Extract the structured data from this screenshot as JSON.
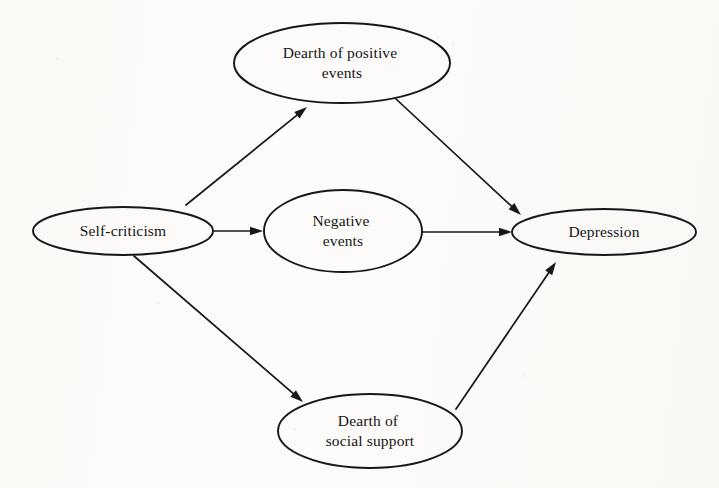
{
  "figure": {
    "background_color": "#fbfaf8",
    "stroke_color": "#17171a",
    "text_color": "#141417"
  },
  "nodes": [
    {
      "id": "self-criticism",
      "label_line1": "Self-criticism",
      "label_line2": "",
      "cx": 123,
      "cy": 231,
      "rx": 90,
      "ry": 24
    },
    {
      "id": "dearth-of-positive-events",
      "label_line1": "Dearth of positive",
      "label_line2": "events",
      "cx": 342,
      "cy": 63,
      "rx": 108,
      "ry": 40
    },
    {
      "id": "negative-events",
      "label_line1": "Negative",
      "label_line2": "events",
      "cx": 343,
      "cy": 231,
      "rx": 79,
      "ry": 41
    },
    {
      "id": "dearth-of-social-support",
      "label_line1": "Dearth of",
      "label_line2": "social support",
      "cx": 370,
      "cy": 431,
      "rx": 92,
      "ry": 37
    },
    {
      "id": "depression",
      "label_line1": "Depression",
      "label_line2": "",
      "cx": 604,
      "cy": 232,
      "rx": 92,
      "ry": 23
    }
  ],
  "edges": [
    {
      "id": "self-criticism-to-dearth-of-positive-events",
      "from": "self-criticism",
      "to": "dearth-of-positive-events",
      "x1": 186,
      "y1": 205,
      "x2": 307,
      "y2": 107
    },
    {
      "id": "self-criticism-to-negative-events",
      "from": "self-criticism",
      "to": "negative-events",
      "x1": 214,
      "y1": 231,
      "x2": 263,
      "y2": 231
    },
    {
      "id": "self-criticism-to-dearth-of-social-support",
      "from": "self-criticism",
      "to": "dearth-of-social-support",
      "x1": 134,
      "y1": 256,
      "x2": 303,
      "y2": 402
    },
    {
      "id": "dearth-of-positive-events-to-depression",
      "from": "dearth-of-positive-events",
      "to": "depression",
      "x1": 396,
      "y1": 99,
      "x2": 521,
      "y2": 215
    },
    {
      "id": "negative-events-to-depression",
      "from": "negative-events",
      "to": "depression",
      "x1": 422,
      "y1": 232,
      "x2": 512,
      "y2": 232
    },
    {
      "id": "dearth-of-social-support-to-depression",
      "from": "dearth-of-social-support",
      "to": "depression",
      "x1": 456,
      "y1": 409,
      "x2": 556,
      "y2": 262
    }
  ]
}
